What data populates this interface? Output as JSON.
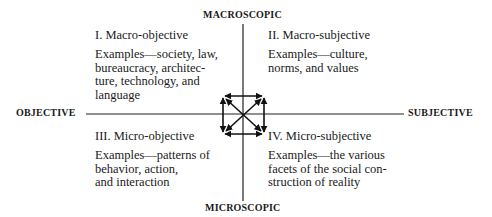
{
  "axes": {
    "top": "MACROSCOPIC",
    "bottom": "MICROSCOPIC",
    "left": "OBJECTIVE",
    "right": "SUBJECTIVE"
  },
  "quadrants": [
    {
      "id": "I",
      "title": "I.  Macro-objective",
      "lines": [
        "Examples—society, law,",
        "bureaucracy, architec-",
        "ture, technology, and",
        "language"
      ]
    },
    {
      "id": "II",
      "title": "II.  Macro-subjective",
      "lines": [
        "Examples—culture,",
        "norms, and values"
      ]
    },
    {
      "id": "III",
      "title": "III.  Micro-objective",
      "lines": [
        "Examples—patterns of",
        "behavior, action,",
        "and interaction"
      ]
    },
    {
      "id": "IV",
      "title": "IV.  Micro-subjective",
      "lines": [
        "Examples—the various",
        "facets of the social con-",
        "struction of reality"
      ]
    }
  ],
  "center_graphic": "bidirectional-arrows-square-with-diagonals"
}
